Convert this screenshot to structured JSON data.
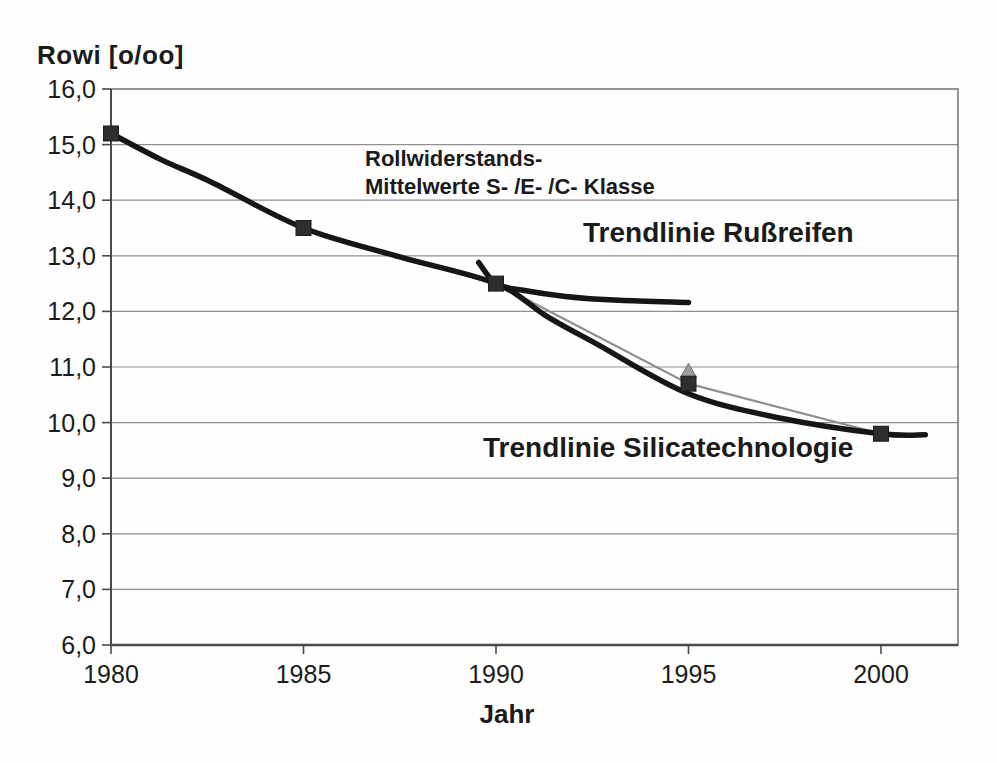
{
  "chart_data": {
    "type": "line",
    "title": "Rowi [o/oo]",
    "xlabel": "Jahr",
    "ylabel": "Rowi [o/oo]",
    "xlim": [
      1980,
      2002
    ],
    "ylim": [
      6.0,
      16.0
    ],
    "grid": "horizontal",
    "x_ticks": [
      {
        "value": 1980,
        "label": "1980"
      },
      {
        "value": 1985,
        "label": "1985"
      },
      {
        "value": 1990,
        "label": "1990"
      },
      {
        "value": 1995,
        "label": "1995"
      },
      {
        "value": 2000,
        "label": "2000"
      }
    ],
    "y_ticks": [
      {
        "value": 16.0,
        "label": "16,0"
      },
      {
        "value": 15.0,
        "label": "15,0"
      },
      {
        "value": 14.0,
        "label": "14,0"
      },
      {
        "value": 13.0,
        "label": "13,0"
      },
      {
        "value": 12.0,
        "label": "12,0"
      },
      {
        "value": 11.0,
        "label": "11,0"
      },
      {
        "value": 10.0,
        "label": "10,0"
      },
      {
        "value": 9.0,
        "label": "9,0"
      },
      {
        "value": 8.0,
        "label": "8,0"
      },
      {
        "value": 7.0,
        "label": "7,0"
      },
      {
        "value": 6.0,
        "label": "6,0"
      }
    ],
    "series": [
      {
        "name": "Rollwiderstands-Mittelwerte S-/E-/C-Klasse",
        "role": "data",
        "marker": "square",
        "color": "#8f8f8f",
        "marker_color": "#2e2e2e",
        "width": 2.2,
        "points": [
          [
            1980,
            15.2
          ],
          [
            1985,
            13.5
          ],
          [
            1990,
            12.5
          ],
          [
            1995,
            10.7
          ],
          [
            2000,
            9.8
          ]
        ]
      },
      {
        "name": "Trendlinie Rußreifen",
        "role": "trend",
        "color": "#161616",
        "width": 5.5,
        "points": [
          [
            1989.55,
            12.88
          ],
          [
            1990,
            12.5
          ],
          [
            1990.7,
            12.38
          ],
          [
            1991.8,
            12.27
          ],
          [
            1993.2,
            12.2
          ],
          [
            1995,
            12.16
          ]
        ]
      },
      {
        "name": "Trendlinie Silicatechnologie",
        "role": "trend",
        "color": "#161616",
        "width": 5.5,
        "points": [
          [
            1980,
            15.2
          ],
          [
            1981.3,
            14.73
          ],
          [
            1982.6,
            14.33
          ],
          [
            1985,
            13.5
          ],
          [
            1987.5,
            12.98
          ],
          [
            1990,
            12.5
          ],
          [
            1991.3,
            11.92
          ],
          [
            1992.6,
            11.42
          ],
          [
            1995,
            10.52
          ],
          [
            1997.4,
            10.08
          ],
          [
            2000,
            9.8
          ],
          [
            2001.15,
            9.78
          ]
        ]
      }
    ],
    "extra_marker": {
      "shape": "triangle-up",
      "x": 1995,
      "y": 10.92,
      "color": "#9c9c9c"
    },
    "annotations": [
      {
        "text": "Rollwiderstands-"
      },
      {
        "text": "Mittelwerte S- /E- /C- Klasse"
      },
      {
        "text": "Trendlinie Rußreifen"
      },
      {
        "text": "Trendlinie Silicatechnologie"
      }
    ],
    "colors": {
      "trend_line": "#161616",
      "data_line": "#8f8f8f",
      "marker_fill": "#2e2e2e",
      "gridline": "#8f8f8f",
      "axis": "#4a4a4a",
      "text": "#1b1b1b",
      "background": "#fefefe"
    }
  }
}
